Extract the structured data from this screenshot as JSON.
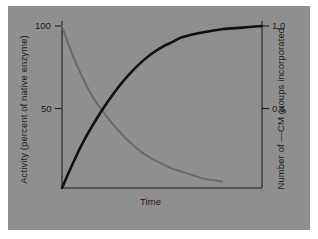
{
  "figure": {
    "background_color": "#ffffff",
    "panel_color": "#8f8f8f"
  },
  "chart_data": {
    "type": "line",
    "title": "",
    "xlabel": "Time",
    "ylabel": "Activity (percent of native enzyme)",
    "y2label": "Number of —CM groups incorporated",
    "grid": false,
    "legend": "none",
    "xlim": [
      0,
      1
    ],
    "ylim": [
      0,
      110
    ],
    "y2lim": [
      0,
      1.1
    ],
    "xticks": [],
    "xticklabels": [],
    "yticks": [
      50,
      100
    ],
    "yticklabels": [
      "50",
      "100"
    ],
    "y2ticks": [
      0.5,
      1.0
    ],
    "y2ticklabels": [
      "0.5",
      "1.0"
    ],
    "series": [
      {
        "name": "Activity (percent of native enzyme)",
        "axis": "left",
        "color": "#6b6b6b",
        "linewidth": 2.0,
        "description": "exponential decay from 100 percent toward 0",
        "x": [
          0.0,
          0.05,
          0.1,
          0.15,
          0.2,
          0.25,
          0.3,
          0.35,
          0.4,
          0.45,
          0.5,
          0.55,
          0.6,
          0.65,
          0.7,
          0.75,
          0.8
        ],
        "y": [
          100,
          83,
          69,
          57,
          48,
          40,
          33,
          27,
          22,
          18,
          15,
          12,
          10,
          8,
          6,
          5,
          4
        ]
      },
      {
        "name": "Number of —CM groups incorporated",
        "axis": "right",
        "color": "#111111",
        "linewidth": 2.6,
        "description": "saturating exponential rise from 0 toward 1.0",
        "x": [
          0.0,
          0.05,
          0.1,
          0.15,
          0.2,
          0.25,
          0.3,
          0.35,
          0.4,
          0.45,
          0.5,
          0.55,
          0.6,
          0.7,
          0.8,
          0.9,
          1.0
        ],
        "y": [
          0.0,
          0.14,
          0.27,
          0.38,
          0.48,
          0.57,
          0.65,
          0.72,
          0.78,
          0.83,
          0.87,
          0.9,
          0.93,
          0.96,
          0.98,
          0.99,
          1.0
        ]
      }
    ],
    "annotations": [
      {
        "text": "curves cross near 50 percent activity / 0.5 groups"
      }
    ]
  }
}
